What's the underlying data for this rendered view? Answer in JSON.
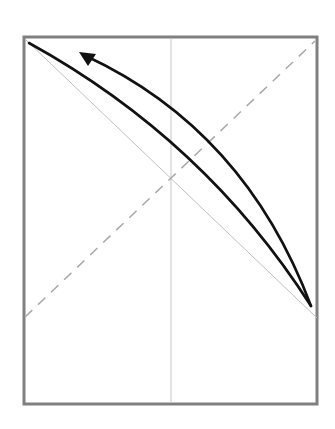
{
  "diagram": {
    "type": "line-plot-schematic",
    "frame": {
      "x": 24,
      "y": 37,
      "width": 293,
      "height": 367,
      "stroke": "#808080",
      "stroke_width": 3
    },
    "vertical_midline": {
      "x": 171,
      "y1": 38,
      "y2": 403,
      "stroke": "#c8c8c8",
      "stroke_width": 1
    },
    "diagonal_reference": {
      "x1": 26,
      "y1": 40,
      "x2": 317,
      "y2": 318,
      "stroke": "#c0c0c0",
      "stroke_width": 1
    },
    "dashed_line": {
      "x1": 25,
      "y1": 317,
      "x2": 315,
      "y2": 41,
      "stroke": "#a8a8a8",
      "stroke_width": 1.5,
      "dash": "10 8"
    },
    "lower_curve": {
      "path": "M 29 43 Q 205 140 311 306",
      "stroke": "#111111",
      "stroke_width": 2.6
    },
    "return_curve": {
      "path": "M 311 306 Q 245 130 86 56",
      "stroke": "#111111",
      "stroke_width": 2.6
    },
    "arrowhead": {
      "points": "79,52 96,54 88,66",
      "fill": "#111111"
    },
    "colors": {
      "background": "#ffffff",
      "frame": "#808080",
      "curve": "#111111",
      "reference": "#c0c0c0",
      "dashed": "#a8a8a8"
    }
  }
}
